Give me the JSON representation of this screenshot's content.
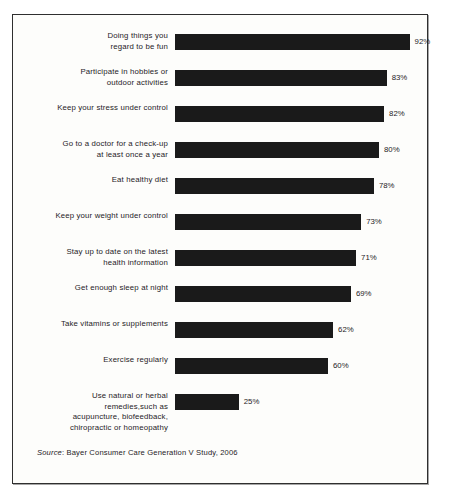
{
  "chart_data": {
    "type": "bar",
    "orientation": "horizontal",
    "title": "",
    "xlabel": "",
    "ylabel": "",
    "xlim": [
      0,
      100
    ],
    "grid": false,
    "legend": null,
    "value_suffix": "%",
    "categories": [
      "Doing things you\nregard to be fun",
      "Participate in hobbies or\noutdoor activities",
      "Keep your stress under control",
      "Go to a doctor for a check-up\nat least once a year",
      "Eat healthy diet",
      "Keep your weight under control",
      "Stay up to date on the latest\nhealth information",
      "Get enough sleep at night",
      "Take vitamins or supplements",
      "Exercise regularly",
      "Use natural or herbal\nremedies,such as\nacupuncture, biofeedback,\nchiropractic or homeopathy"
    ],
    "values": [
      92,
      83,
      82,
      80,
      78,
      73,
      71,
      69,
      62,
      60,
      25
    ],
    "value_labels": [
      "92%",
      "83%",
      "82%",
      "80%",
      "78%",
      "73%",
      "71%",
      "69%",
      "62%",
      "60%",
      "25%"
    ],
    "bar_color": "#1a1a1a",
    "background_color": "#fdfdfb",
    "border_color": "#2f2f2f"
  },
  "source": {
    "label": "Source",
    "separator": ": ",
    "text": "Bayer Consumer Care Generation V Study, 2006"
  }
}
